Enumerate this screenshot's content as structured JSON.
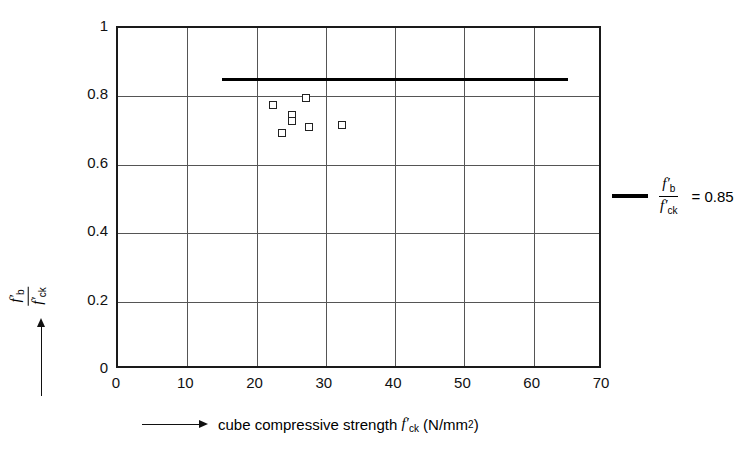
{
  "chart_data": {
    "type": "scatter",
    "title": "",
    "xlabel": "cube compressive strength f'ck (N/mm2)",
    "ylabel": "f'b / f'ck",
    "xlim": [
      0,
      70
    ],
    "ylim": [
      0,
      1
    ],
    "grid": true,
    "x_ticks": [
      "0",
      "10",
      "20",
      "30",
      "40",
      "50",
      "60",
      "70"
    ],
    "x_tick_values": [
      0,
      10,
      20,
      30,
      40,
      50,
      60,
      70
    ],
    "y_ticks": [
      "0",
      "0.2",
      "0.4",
      "0.6",
      "0.8",
      "1"
    ],
    "y_tick_values": [
      0,
      0.2,
      0.4,
      0.6,
      0.8,
      1
    ],
    "series": [
      {
        "name": "measured data",
        "marker": "open-square",
        "points": [
          {
            "x": 22.4,
            "y": 0.775
          },
          {
            "x": 25.1,
            "y": 0.745
          },
          {
            "x": 25.1,
            "y": 0.728
          },
          {
            "x": 23.7,
            "y": 0.693
          },
          {
            "x": 27.1,
            "y": 0.795
          },
          {
            "x": 27.6,
            "y": 0.71
          },
          {
            "x": 32.3,
            "y": 0.716
          }
        ]
      }
    ],
    "reference_line": {
      "label": "f'b / f'ck = 0.85",
      "value": 0.85,
      "x_start": 15,
      "x_end": 65,
      "color": "#000000"
    },
    "legend": {
      "position": "right",
      "entries": [
        {
          "marker": "thick-line",
          "numerator": "f",
          "numerator_sub": "b",
          "denominator": "f",
          "denominator_sub": "ck",
          "equals": "= 0.85"
        }
      ]
    }
  },
  "axes": {
    "x_title": {
      "text_before": "cube compressive strength",
      "symbol_base": "f",
      "symbol_sub": "ck",
      "text_after_open": "(N/mm",
      "exponent": "2",
      "text_after_close": ")"
    },
    "y_title": {
      "numerator_base": "f",
      "numerator_sub": "b",
      "denominator_base": "f",
      "denominator_sub": "ck"
    }
  },
  "legend_text": {
    "numerator_base": "f",
    "numerator_sub": "b",
    "denominator_base": "f",
    "denominator_sub": "ck",
    "equation": "= 0.85"
  },
  "colors": {
    "axis": "#1a1a1a",
    "grid": "#555555",
    "marker_edge": "#222222",
    "reference_line": "#000000"
  }
}
